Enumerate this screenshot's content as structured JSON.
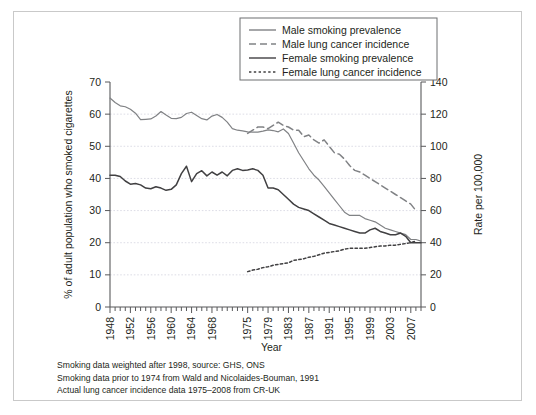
{
  "figure": {
    "frame_border_color": "#c9c9c9",
    "background": "#ffffff"
  },
  "axes": {
    "x_title": "Year",
    "y_left_title": "% of adult population who smoked cigarettes",
    "y_right_title": "Rate per 100,000",
    "x_tick_labels": [
      "1948",
      "1952",
      "1956",
      "1960",
      "1964",
      "1968",
      "1975",
      "1979",
      "1983",
      "1987",
      "1991",
      "1995",
      "1999",
      "2003",
      "2007"
    ],
    "y_left_ticks": [
      "0",
      "10",
      "20",
      "30",
      "40",
      "50",
      "60",
      "70"
    ],
    "y_right_ticks": [
      "0",
      "20",
      "40",
      "60",
      "80",
      "100",
      "120",
      "140"
    ]
  },
  "legend": {
    "position": "top-center",
    "items": [
      {
        "label": "Male smoking prevalence",
        "style": "solid",
        "color": "#808285"
      },
      {
        "label": "Male lung cancer incidence",
        "style": "dashed",
        "color": "#808285"
      },
      {
        "label": "Female smoking prevalence",
        "style": "solid",
        "color": "#414042"
      },
      {
        "label": "Female lung cancer incidence",
        "style": "dotted",
        "color": "#414042"
      }
    ]
  },
  "footnotes": [
    "Smoking data weighted after 1998, source: GHS, ONS",
    "Smoking data prior to 1974 from Wald and Nicolaides-Bouman, 1991",
    "Actual lung cancer incidence data 1975–2008 from CR-UK"
  ],
  "chart_data": {
    "type": "line",
    "title": "",
    "xlabel": "Year",
    "ylabel": "% of adult population who smoked cigarettes",
    "ylabel_secondary": "Rate per 100,000",
    "xlim": [
      1948,
      2009
    ],
    "ylim": [
      0,
      70
    ],
    "ylim_secondary": [
      0,
      140
    ],
    "grid": true,
    "legend_position": "top-center",
    "series": [
      {
        "name": "Male smoking prevalence",
        "axis": "left",
        "style": "solid",
        "color": "#808285",
        "x": [
          1948,
          1949,
          1950,
          1951,
          1952,
          1953,
          1954,
          1955,
          1956,
          1957,
          1958,
          1959,
          1960,
          1961,
          1962,
          1963,
          1964,
          1965,
          1966,
          1967,
          1968,
          1969,
          1970,
          1971,
          1972,
          1973,
          1974,
          1975,
          1976,
          1977,
          1978,
          1979,
          1980,
          1981,
          1982,
          1983,
          1984,
          1985,
          1986,
          1987,
          1988,
          1989,
          1990,
          1991,
          1992,
          1993,
          1994,
          1995,
          1996,
          1997,
          1998,
          1999,
          2000,
          2001,
          2002,
          2003,
          2004,
          2005,
          2006,
          2007,
          2008,
          2009
        ],
        "y": [
          65.0,
          63.6,
          62.6,
          62.3,
          61.5,
          60.3,
          58.3,
          58.4,
          58.5,
          59.4,
          60.8,
          59.7,
          58.7,
          58.6,
          59.0,
          60.2,
          60.6,
          59.6,
          58.6,
          58.2,
          59.4,
          59.9,
          59.0,
          57.5,
          55.5,
          55.0,
          54.8,
          54.5,
          54.4,
          54.4,
          54.7,
          55.1,
          54.9,
          54.5,
          55.4,
          54.0,
          51.0,
          48.0,
          45.5,
          43.0,
          41.0,
          39.5,
          37.5,
          35.5,
          33.5,
          31.5,
          29.5,
          28.5,
          28.5,
          28.5,
          27.5,
          27.0,
          26.5,
          25.5,
          24.5,
          24.0,
          23.5,
          23.0,
          22.5,
          21.0,
          21.0,
          20.5
        ]
      },
      {
        "name": "Male lung cancer incidence",
        "axis": "right",
        "style": "dashed",
        "color": "#808285",
        "x": [
          1975,
          1976,
          1977,
          1978,
          1979,
          1980,
          1981,
          1982,
          1983,
          1984,
          1985,
          1986,
          1987,
          1988,
          1989,
          1990,
          1991,
          1992,
          1993,
          1994,
          1995,
          1996,
          1997,
          1998,
          1999,
          2000,
          2001,
          2002,
          2003,
          2004,
          2005,
          2006,
          2007,
          2008
        ],
        "y": [
          108,
          110,
          112,
          112,
          111,
          113,
          115,
          113,
          112,
          110,
          110,
          106,
          107,
          104,
          102,
          104,
          100,
          96,
          95,
          92,
          88,
          85,
          84,
          82,
          80,
          78,
          76,
          74,
          72,
          70,
          68,
          66,
          64,
          60
        ]
      },
      {
        "name": "Female smoking prevalence",
        "axis": "left",
        "style": "solid",
        "color": "#414042",
        "x": [
          1948,
          1949,
          1950,
          1951,
          1952,
          1953,
          1954,
          1955,
          1956,
          1957,
          1958,
          1959,
          1960,
          1961,
          1962,
          1963,
          1964,
          1965,
          1966,
          1967,
          1968,
          1969,
          1970,
          1971,
          1972,
          1973,
          1974,
          1975,
          1976,
          1977,
          1978,
          1979,
          1980,
          1981,
          1982,
          1983,
          1984,
          1985,
          1986,
          1987,
          1988,
          1989,
          1990,
          1991,
          1992,
          1993,
          1994,
          1995,
          1996,
          1997,
          1998,
          1999,
          2000,
          2001,
          2002,
          2003,
          2004,
          2005,
          2006,
          2007,
          2008,
          2009
        ],
        "y": [
          41.0,
          41.0,
          40.6,
          39.2,
          38.2,
          38.4,
          38.0,
          37.0,
          36.8,
          37.4,
          37.0,
          36.3,
          36.6,
          38.0,
          41.5,
          43.8,
          39.0,
          41.5,
          42.4,
          40.8,
          42.0,
          41.0,
          42.0,
          40.8,
          42.5,
          43.0,
          42.5,
          42.6,
          43.0,
          42.5,
          41.0,
          37.0,
          37.0,
          36.5,
          35.0,
          33.5,
          32.0,
          31.0,
          30.5,
          30.0,
          29.0,
          28.0,
          27.0,
          26.0,
          25.5,
          25.0,
          24.5,
          24.0,
          23.5,
          23.0,
          23.0,
          24.0,
          24.5,
          23.5,
          23.0,
          22.5,
          22.5,
          23.0,
          22.0,
          20.0,
          20.0,
          20.0
        ]
      },
      {
        "name": "Female lung cancer incidence",
        "axis": "right",
        "style": "dotted",
        "color": "#414042",
        "x": [
          1975,
          1976,
          1977,
          1978,
          1979,
          1980,
          1981,
          1982,
          1983,
          1984,
          1985,
          1986,
          1987,
          1988,
          1989,
          1990,
          1991,
          1992,
          1993,
          1994,
          1995,
          1996,
          1997,
          1998,
          1999,
          2000,
          2001,
          2002,
          2003,
          2004,
          2005,
          2006,
          2007,
          2008
        ],
        "y": [
          22,
          23,
          23.5,
          24.5,
          25,
          26,
          26.5,
          27,
          27.5,
          29,
          29.5,
          30,
          31,
          31.5,
          32.5,
          33.5,
          34,
          34.5,
          35,
          36,
          36.5,
          36.5,
          36.5,
          36.5,
          37,
          37.5,
          38,
          38,
          38.5,
          38.5,
          39,
          39.5,
          40,
          41
        ]
      }
    ]
  }
}
